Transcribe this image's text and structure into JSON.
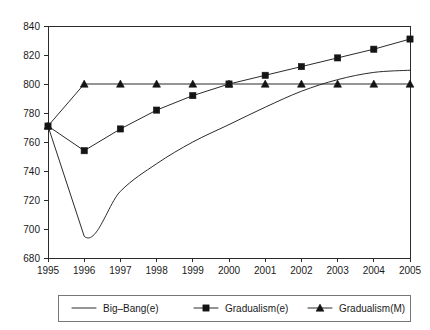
{
  "chart_data": {
    "type": "line",
    "title": "",
    "subtitle": "",
    "xlabel": "",
    "ylabel": "",
    "x": [
      1995,
      1996,
      1997,
      1998,
      1999,
      2000,
      2001,
      2002,
      2003,
      2004,
      2005
    ],
    "categories": [
      "1995",
      "1996",
      "1997",
      "1998",
      "1999",
      "2000",
      "2001",
      "2002",
      "2003",
      "2004",
      "2005"
    ],
    "xlim": [
      1995,
      2005
    ],
    "ylim": [
      680,
      840
    ],
    "yticks": [
      680,
      700,
      720,
      740,
      760,
      780,
      800,
      820,
      840
    ],
    "ytick_labels": [
      "680",
      "700",
      "720",
      "740",
      "760",
      "780",
      "800",
      "820",
      "840"
    ],
    "xticks": [
      1995,
      1996,
      1997,
      1998,
      1999,
      2000,
      2001,
      2002,
      2003,
      2004,
      2005
    ],
    "xtick_labels": [
      "1995",
      "1996",
      "1997",
      "1998",
      "1999",
      "2000",
      "2001",
      "2002",
      "2003",
      "2004",
      "2005"
    ],
    "grid": false,
    "legend_position": "bottom",
    "series": [
      {
        "name": "Big–Bang(e)",
        "marker": "none",
        "values": [
          771,
          695,
          726,
          745,
          760,
          772,
          784,
          795,
          803,
          808,
          809.5
        ]
      },
      {
        "name": "Gradualism(e)",
        "marker": "square",
        "values": [
          771,
          754,
          769,
          782,
          792,
          800,
          806,
          812,
          818,
          824,
          831
        ]
      },
      {
        "name": "Gradualism(M)",
        "marker": "triangle",
        "values": [
          771,
          800,
          800,
          800,
          800,
          800,
          800,
          800,
          800,
          800,
          800
        ]
      }
    ],
    "colors": {
      "line": "#2b2b2b",
      "marker": "#141414",
      "axis": "#2b2b2b",
      "legend_border": "#777777",
      "background": "#ffffff"
    }
  },
  "legend": {
    "items": [
      {
        "label": "Big–Bang(e)",
        "marker": "none"
      },
      {
        "label": "Gradualism(e)",
        "marker": "square"
      },
      {
        "label": "Gradualism(M)",
        "marker": "triangle"
      }
    ]
  }
}
